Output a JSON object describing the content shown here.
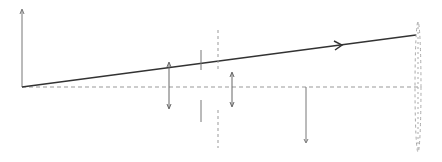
{
  "diagram": {
    "type": "vector-projection-sketch",
    "width": 442,
    "height": 162,
    "colors": {
      "background": "#ffffff",
      "main_line": "#333333",
      "axis": "#777777",
      "dashed": "#999999",
      "arrows": "#666666",
      "ticks": "#777777"
    },
    "elements": {
      "y_axis": {
        "x": 22,
        "y1": 87,
        "y2": 10
      },
      "baseline": {
        "y": 87,
        "x1": 22,
        "x2": 420
      },
      "main_vector": {
        "x1": 22,
        "y1": 87,
        "x2": 416,
        "y2": 35,
        "mid_arrow_x": 340
      },
      "dashed_vertical_mid": {
        "x": 218,
        "segments": [
          [
            30,
            72
          ],
          [
            110,
            148
          ]
        ]
      },
      "solid_ticks": {
        "x": 201,
        "segments": [
          [
            50,
            70
          ],
          [
            100,
            122
          ]
        ]
      },
      "double_arrow_left": {
        "x": 169,
        "y1": 63,
        "y2": 108
      },
      "double_arrow_right": {
        "x": 232,
        "y1": 73,
        "y2": 106
      },
      "down_arrow": {
        "x": 306,
        "y1": 87,
        "y2": 142
      },
      "end_ellipse": {
        "cx": 418,
        "top": 22,
        "bottom": 152
      }
    }
  }
}
